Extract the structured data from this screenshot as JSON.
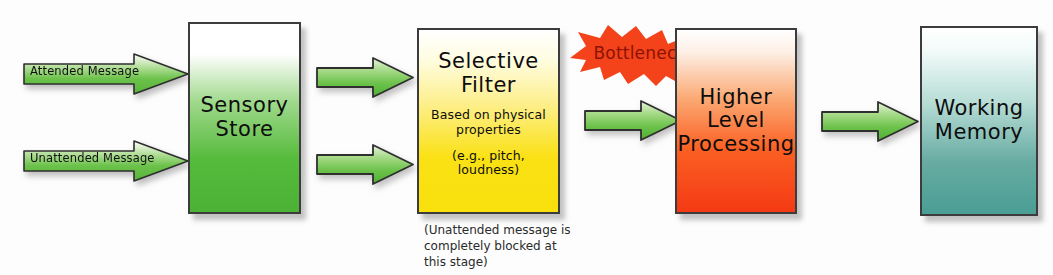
{
  "diagram": {
    "background": "#fdfdfd"
  },
  "inputs": [
    {
      "id": "attended",
      "label": "Attended Message",
      "icon": "right-arrow-icon",
      "color": "#6cc24a"
    },
    {
      "id": "unattended",
      "label": "Unattended Message",
      "icon": "right-arrow-icon",
      "color": "#6cc24a"
    }
  ],
  "stages": {
    "sensory_store": {
      "title": "Sensory\nStore",
      "color_top": "#ffffff",
      "color_bottom": "#4cb236"
    },
    "selective_filter": {
      "title": "Selective\nFilter",
      "detail_line1": "Based on physical\nproperties",
      "detail_line2": "(e.g., pitch,\nloudness)",
      "caption": "(Unattended message is\ncompletely blocked at\nthis stage)",
      "color_top": "#ffffff",
      "color_bottom": "#f8e00c"
    },
    "higher_level": {
      "title": "Higher\nLevel\nProcessing",
      "color_top": "#ffffff",
      "color_bottom": "#f43a14"
    },
    "working_memory": {
      "title": "Working\nMemory",
      "color_top": "#ffffff",
      "color_bottom": "#4a9e94"
    }
  },
  "annotation": {
    "bottleneck_label": "Bottleneck",
    "burst_color": "#f4431a",
    "burst_text_color": "#8a1305"
  },
  "connectors": [
    {
      "id": "store-to-filter-top",
      "icon": "right-arrow-icon"
    },
    {
      "id": "store-to-filter-bottom",
      "icon": "right-arrow-icon"
    },
    {
      "id": "filter-to-higher",
      "icon": "right-arrow-icon"
    },
    {
      "id": "higher-to-working",
      "icon": "right-arrow-icon"
    }
  ]
}
